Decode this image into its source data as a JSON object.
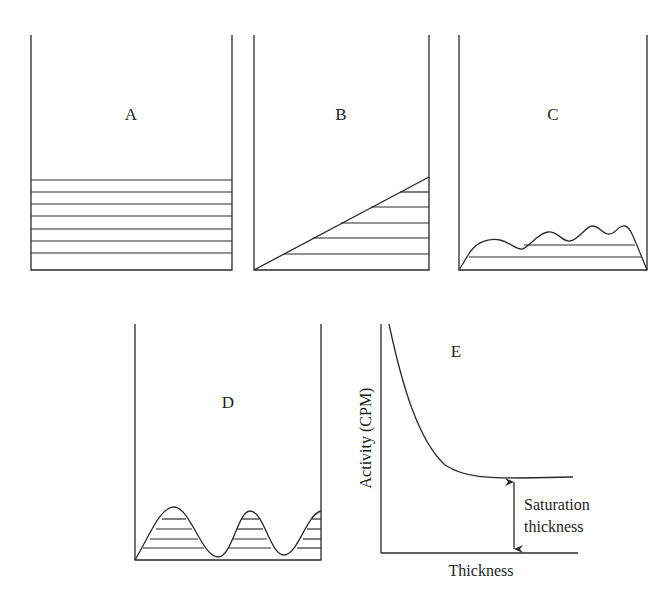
{
  "panels": {
    "A": {
      "label": "A",
      "description": "Uniform flat layers of sample"
    },
    "B": {
      "label": "B",
      "description": "Sloped (wedge-shaped) sample"
    },
    "C": {
      "label": "C",
      "description": "Uneven, slightly wavy thin sample"
    },
    "D": {
      "label": "D",
      "description": "Strongly wavy sample with peaks and troughs"
    },
    "E": {
      "label": "E",
      "y_axis_label": "Activity (CPM)",
      "x_axis_label": "Thickness",
      "annotation_line1": "Saturation",
      "annotation_line2": "thickness"
    }
  },
  "colors": {
    "line": "#2a2a2a",
    "text": "#1e1e1e",
    "background": "#ffffff"
  }
}
